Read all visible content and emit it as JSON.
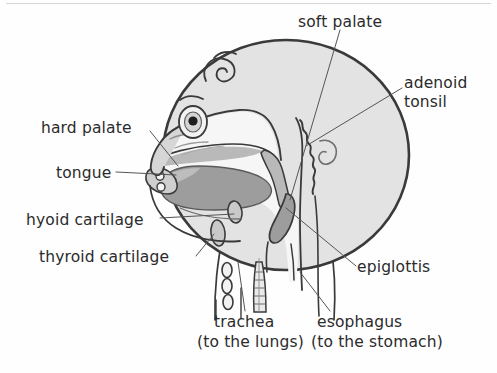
{
  "figure": {
    "type": "anatomical-diagram",
    "colors": {
      "background": "#fefefe",
      "head_fill": "#e3e3e3",
      "outline": "#3a3a3a",
      "tongue_fill": "#9d9d9d",
      "palate_fill": "#b9b9b9",
      "cartilage_fill": "#c9c9c9",
      "airway_fill": "#f4f4f4",
      "leader_line": "#555555",
      "text": "#2b2b2b",
      "top_rule": "#d8d6d2"
    }
  },
  "labels": {
    "soft_palate": "soft palate",
    "adenoid_tonsil_line1": "adenoid",
    "adenoid_tonsil_line2": "tonsil",
    "hard_palate": "hard palate",
    "tongue": "tongue",
    "hyoid_cartilage": "hyoid cartilage",
    "thyroid_cartilage": "thyroid cartilage",
    "epiglottis": "epiglottis",
    "trachea": "trachea",
    "trachea_sub": "(to the lungs)",
    "esophagus": "esophagus",
    "esophagus_sub": "(to the stomach)"
  }
}
